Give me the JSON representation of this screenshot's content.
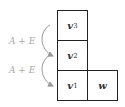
{
  "diagram": {
    "cells": [
      {
        "id": "v3",
        "base": "v",
        "sub": "3"
      },
      {
        "id": "v2",
        "base": "v",
        "sub": "2"
      },
      {
        "id": "v1",
        "base": "v",
        "sub": "1"
      },
      {
        "id": "w",
        "base": "w",
        "sub": ""
      }
    ],
    "arrows": [
      {
        "label": "A + E",
        "from": "v3",
        "to": "v2"
      },
      {
        "label": "A + E",
        "from": "v2",
        "to": "v1"
      }
    ]
  }
}
